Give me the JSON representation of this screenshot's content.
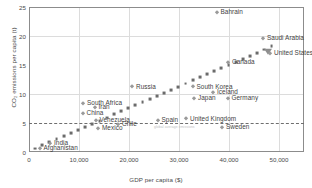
{
  "chart_data": {
    "type": "scatter",
    "title": "",
    "xlabel": "GDP per capita ($)",
    "ylabel": "CO₂ emissions per capita (t)",
    "xlim": [
      0,
      55000
    ],
    "ylim": [
      0,
      25
    ],
    "xticks": [
      "0",
      "10,000",
      "20,000",
      "30,000",
      "40,000",
      "50,000"
    ],
    "xtick_values": [
      0,
      10000,
      20000,
      30000,
      40000,
      50000
    ],
    "yticks": [
      "0",
      "5",
      "10",
      "15",
      "20",
      "25"
    ],
    "ytick_values": [
      0,
      5,
      10,
      15,
      20,
      25
    ],
    "grid": "vertical-and-horizontal-light",
    "legend": "none",
    "reference_line": {
      "label": "global average emissions",
      "orientation": "horizontal",
      "value": 5,
      "style": "dashed"
    },
    "annotations": [
      {
        "name": "trend-arrowhead",
        "x": 47800,
        "y": 17.6,
        "shape": "triangle-down"
      }
    ],
    "trend_line": {
      "style": "dotted-square-markers",
      "x_start": 1200,
      "y_start": 0.6,
      "x_end": 48500,
      "y_end": 18.2,
      "n_dots": 34
    },
    "points": [
      {
        "label": "Bahrain",
        "x": 37500,
        "y": 24.2,
        "label_dx": 4,
        "label_dy": -0.1
      },
      {
        "label": "Saudi Arabia",
        "x": 46800,
        "y": 19.7,
        "label_dx": 4,
        "label_dy": -0.1
      },
      {
        "label": "United States",
        "x": 48200,
        "y": 17.1,
        "label_dx": 4,
        "label_dy": -0.1
      },
      {
        "label": "Canada",
        "x": 39800,
        "y": 15.6,
        "label_dx": 4,
        "label_dy": -0.1
      },
      {
        "label": "South Korea",
        "x": 32700,
        "y": 11.3,
        "label_dx": 4,
        "label_dy": -0.1
      },
      {
        "label": "Iceland",
        "x": 36800,
        "y": 10.3,
        "label_dx": 4,
        "label_dy": -0.1
      },
      {
        "label": "Germany",
        "x": 39700,
        "y": 9.3,
        "label_dx": 4,
        "label_dy": -0.1
      },
      {
        "label": "Japan",
        "x": 33000,
        "y": 9.3,
        "label_dx": 4,
        "label_dy": -0.1
      },
      {
        "label": "Russia",
        "x": 20600,
        "y": 11.3,
        "label_dx": 4,
        "label_dy": -0.1
      },
      {
        "label": "South Africa",
        "x": 10800,
        "y": 8.5,
        "label_dx": 4,
        "label_dy": -0.1
      },
      {
        "label": "Iran",
        "x": 13100,
        "y": 7.8,
        "label_dx": 4,
        "label_dy": -0.1
      },
      {
        "label": "China",
        "x": 10700,
        "y": 6.7,
        "label_dx": 4,
        "label_dy": -0.1
      },
      {
        "label": "Venezuela",
        "x": 13300,
        "y": 5.6,
        "label_dx": 4,
        "label_dy": -0.1
      },
      {
        "label": "Chile",
        "x": 17800,
        "y": 4.9,
        "label_dx": 4,
        "label_dy": -0.1
      },
      {
        "label": "Mexico",
        "x": 13800,
        "y": 4.1,
        "label_dx": 4,
        "label_dy": -0.1
      },
      {
        "label": "Spain",
        "x": 25700,
        "y": 5.6,
        "label_dx": 4,
        "label_dy": -0.1
      },
      {
        "label": "United Kingdom",
        "x": 31400,
        "y": 5.8,
        "label_dx": 4,
        "label_dy": -0.1
      },
      {
        "label": "Sweden",
        "x": 38600,
        "y": 4.3,
        "label_dx": 4,
        "label_dy": -0.1
      },
      {
        "label": "India",
        "x": 4200,
        "y": 1.6,
        "label_dx": 4,
        "label_dy": -0.1
      },
      {
        "label": "Afghanistan",
        "x": 2100,
        "y": 0.7,
        "label_dx": 4,
        "label_dy": -0.1
      }
    ]
  }
}
